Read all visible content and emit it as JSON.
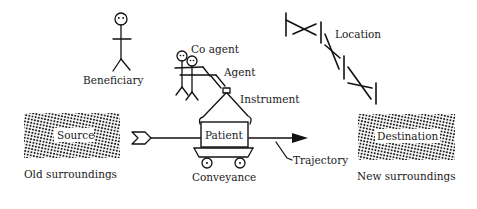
{
  "diagram": {
    "type": "thematic-roles-illustration",
    "labels": {
      "beneficiary": "Beneficiary",
      "co_agent": "Co agent",
      "agent": "Agent",
      "instrument": "Instrument",
      "location": "Location",
      "source": "Source",
      "old_surroundings": "Old surroundings",
      "patient": "Patient",
      "conveyance": "Conveyance",
      "trajectory": "Trajectory",
      "destination": "Destination",
      "new_surroundings": "New surroundings"
    },
    "colors": {
      "ink": "#111111",
      "background": "#ffffff",
      "texture_dot": "#1a1a1a"
    }
  }
}
